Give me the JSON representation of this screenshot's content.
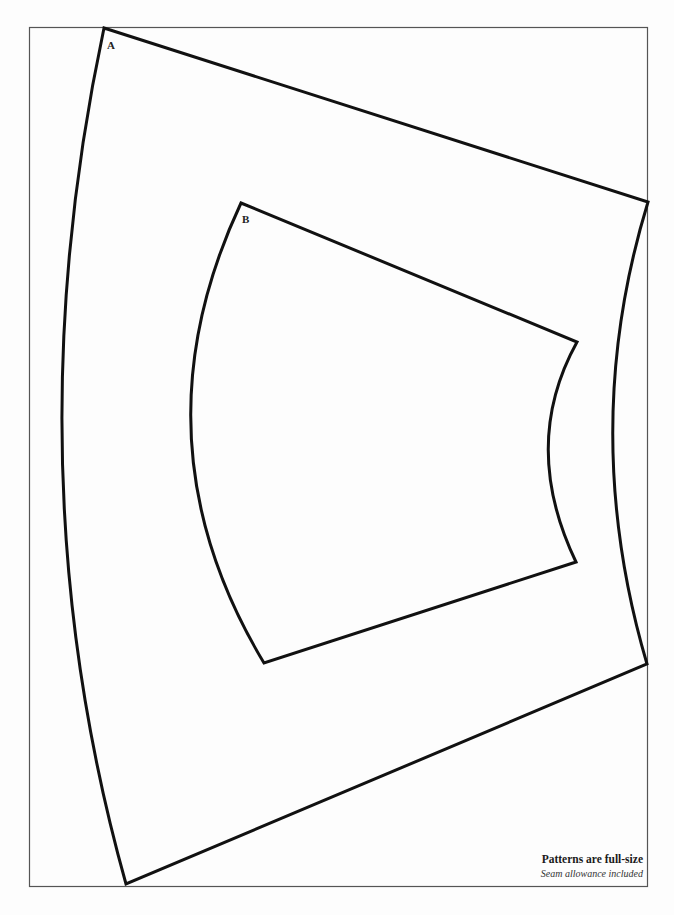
{
  "pieces": [
    {
      "id": "A",
      "label": "A"
    },
    {
      "id": "B",
      "label": "B"
    }
  ],
  "note": {
    "title": "Patterns are full-size",
    "subtitle": "Seam allowance included"
  },
  "colors": {
    "outline": "#111111",
    "frame": "#555555",
    "background": "#fdfdfd"
  }
}
